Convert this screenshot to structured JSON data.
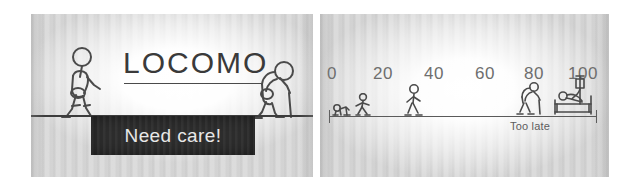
{
  "figure": {
    "panels": [
      {
        "id": "locomo-awareness-panel",
        "title": "LOCOMO",
        "banner_text": "Need care!",
        "figures": [
          {
            "name": "walking-adult-figure",
            "state": "upright walking"
          },
          {
            "name": "stooped-elder-with-cane-figure",
            "state": "stooped, using cane"
          }
        ]
      },
      {
        "id": "life-course-timeline-panel",
        "axis": {
          "tick_labels": [
            "0",
            "20",
            "40",
            "60",
            "80",
            "100"
          ],
          "range": [
            0,
            100
          ],
          "unit_caption": "Too late"
        },
        "figures": [
          {
            "name": "crawling-baby-figure",
            "age": 0
          },
          {
            "name": "walking-child-figure",
            "age": 10
          },
          {
            "name": "walking-adult-figure",
            "age": 35
          },
          {
            "name": "stooped-elder-with-cane-figure",
            "age": 80
          },
          {
            "name": "bedridden-patient-with-iv-figure",
            "age": 95
          }
        ]
      }
    ]
  },
  "colors": {
    "ink": "#4a4a4a",
    "banner_bg": "#2e2e2e",
    "banner_text": "#e8e8e8",
    "tick_text": "#6e6e6e",
    "ground": "#3c3c3c"
  }
}
